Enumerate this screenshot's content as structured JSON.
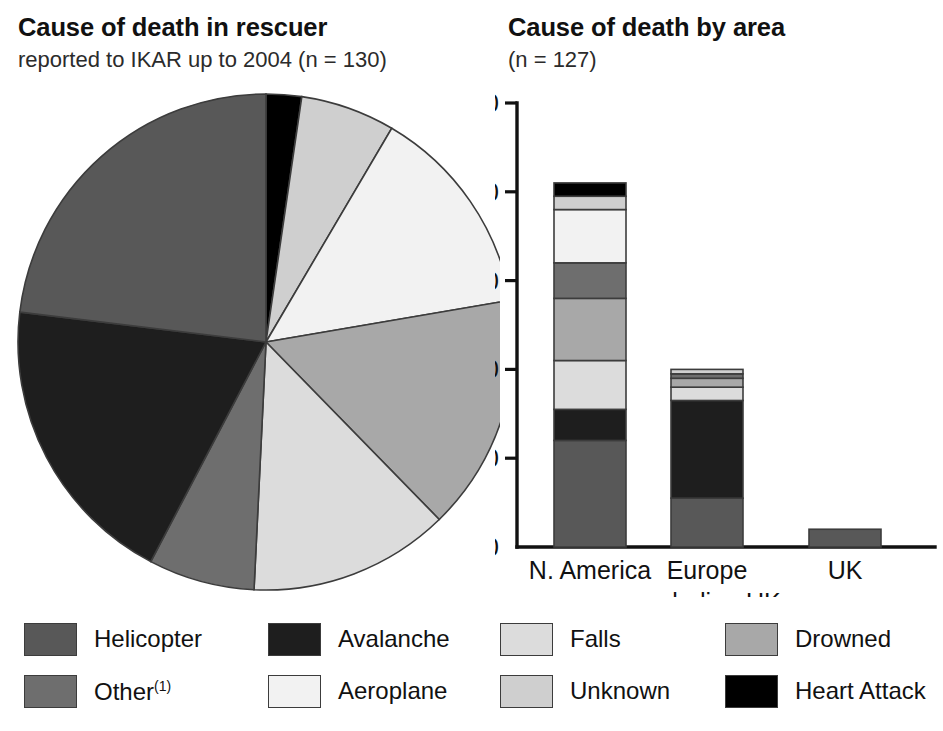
{
  "pie_panel": {
    "title": "Cause of death in rescuer",
    "subtitle": "reported to IKAR up to 2004 (n = 130)"
  },
  "bar_panel": {
    "title": "Cause of death by area",
    "subtitle": "(n = 127)"
  },
  "colors": {
    "helicopter": "#585858",
    "other": "#6e6e6e",
    "avalanche": "#1e1e1e",
    "aeroplane": "#f2f2f2",
    "falls": "#dcdcdc",
    "unknown": "#cfcfcf",
    "drowned": "#a8a8a8",
    "heart_attack": "#000000",
    "stroke": "#3c3c3c",
    "axis": "#111111",
    "background": "#ffffff"
  },
  "legend": {
    "entries": [
      {
        "label": "Helicopter",
        "key": "helicopter",
        "sup": ""
      },
      {
        "label": "Other",
        "key": "other",
        "sup": "(1)"
      },
      {
        "label": "Avalanche",
        "key": "avalanche",
        "sup": ""
      },
      {
        "label": "Aeroplane",
        "key": "aeroplane",
        "sup": ""
      },
      {
        "label": "Falls",
        "key": "falls",
        "sup": ""
      },
      {
        "label": "Unknown",
        "key": "unknown",
        "sup": ""
      },
      {
        "label": "Drowned",
        "key": "drowned",
        "sup": ""
      },
      {
        "label": "Heart Attack",
        "key": "heart_attack",
        "sup": ""
      }
    ]
  },
  "chart_data": [
    {
      "type": "pie",
      "title": "Cause of death in rescuer",
      "subtitle": "reported to IKAR up to 2004 (n = 130)",
      "total": 130,
      "start_angle_deg": -90,
      "direction": "clockwise",
      "labels": [
        "Heart Attack",
        "Unknown",
        "Aeroplane",
        "Drowned",
        "Falls",
        "Other",
        "Avalanche",
        "Helicopter"
      ],
      "values": [
        3,
        8,
        18,
        20,
        17,
        9,
        25,
        30
      ],
      "percent": [
        2.3,
        6.2,
        13.8,
        15.4,
        13.1,
        6.9,
        19.2,
        23.1
      ],
      "slices": [
        {
          "label": "Heart Attack",
          "key": "heart_attack",
          "value": 3,
          "percent": 2.3
        },
        {
          "label": "Unknown",
          "key": "unknown",
          "value": 8,
          "percent": 6.2
        },
        {
          "label": "Aeroplane",
          "key": "aeroplane",
          "value": 18,
          "percent": 13.8
        },
        {
          "label": "Drowned",
          "key": "drowned",
          "value": 20,
          "percent": 15.4
        },
        {
          "label": "Falls",
          "key": "falls",
          "value": 17,
          "percent": 13.1
        },
        {
          "label": "Other",
          "key": "other",
          "value": 9,
          "percent": 6.9
        },
        {
          "label": "Avalanche",
          "key": "avalanche",
          "value": 25,
          "percent": 19.2
        },
        {
          "label": "Helicopter",
          "key": "helicopter",
          "value": 30,
          "percent": 23.1
        }
      ]
    },
    {
      "type": "bar",
      "stacked": true,
      "title": "Cause of death by area",
      "subtitle": "(n = 127)",
      "xlabel": "",
      "ylabel": "",
      "ylim": [
        0,
        100
      ],
      "yticks": [
        0,
        20,
        40,
        60,
        80,
        100
      ],
      "ytick_labels": [
        "0",
        "20",
        "40",
        "60",
        "80",
        "100"
      ],
      "grid": false,
      "legend_position": "bottom",
      "categories": [
        "N. America",
        "Europe",
        "UK"
      ],
      "category_sublabels": [
        "",
        "excluding UK",
        ""
      ],
      "series": [
        {
          "name": "Helicopter",
          "key": "helicopter",
          "values": [
            24,
            11,
            4
          ]
        },
        {
          "name": "Avalanche",
          "key": "avalanche",
          "values": [
            7,
            22,
            0
          ]
        },
        {
          "name": "Falls",
          "key": "falls",
          "values": [
            11,
            3,
            0
          ]
        },
        {
          "name": "Drowned",
          "key": "drowned",
          "values": [
            14,
            2,
            0
          ]
        },
        {
          "name": "Other",
          "key": "other",
          "values": [
            8,
            1,
            0
          ]
        },
        {
          "name": "Aeroplane",
          "key": "aeroplane",
          "values": [
            12,
            0,
            0
          ]
        },
        {
          "name": "Unknown",
          "key": "unknown",
          "values": [
            3,
            1,
            0
          ]
        },
        {
          "name": "Heart Attack",
          "key": "heart_attack",
          "values": [
            3,
            0,
            0
          ]
        }
      ],
      "totals": [
        82,
        40,
        4
      ]
    }
  ]
}
